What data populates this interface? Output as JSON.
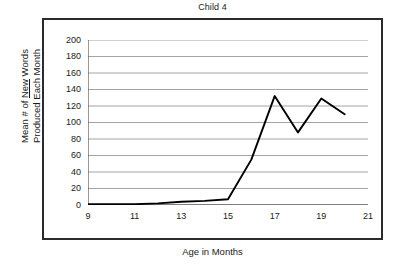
{
  "chart_data": {
    "type": "line",
    "title": "Child 4",
    "xlabel": "Age in Months",
    "ylabel_line1_pre": "Mean # of ",
    "ylabel_line1_underlined": "New",
    "ylabel_line1_post": " Words",
    "ylabel_line2": "Produced Each Month",
    "ylabel_plain": "Mean # of New Words Produced Each Month",
    "x": [
      9,
      10,
      11,
      12,
      13,
      14,
      15,
      16,
      17,
      18,
      19,
      20
    ],
    "values": [
      1,
      1,
      1,
      2,
      4,
      5,
      7,
      55,
      132,
      88,
      129,
      110
    ],
    "series": [
      {
        "name": "Child 4",
        "values": [
          1,
          1,
          1,
          2,
          4,
          5,
          7,
          55,
          132,
          88,
          129,
          110
        ]
      }
    ],
    "xlim": [
      9,
      21
    ],
    "ylim": [
      0,
      200
    ],
    "ytick_labels": [
      "200",
      "180",
      "160",
      "140",
      "120",
      "100",
      "80",
      "60",
      "40",
      "20",
      "0"
    ],
    "ytick_values": [
      200,
      180,
      160,
      140,
      120,
      100,
      80,
      60,
      40,
      20,
      0
    ],
    "xtick_labels": [
      "9",
      "11",
      "13",
      "15",
      "17",
      "19",
      "21"
    ],
    "xtick_values": [
      9,
      11,
      13,
      15,
      17,
      19,
      21
    ],
    "xminor_values": [
      10,
      12,
      14,
      16,
      18,
      20
    ],
    "grid": "horizontal",
    "legend": "none",
    "line_color": "#000000",
    "grid_color": "#9a9a9a",
    "axis_color": "#555555",
    "frame_color": "#2b2b2b",
    "background": "#ffffff"
  }
}
